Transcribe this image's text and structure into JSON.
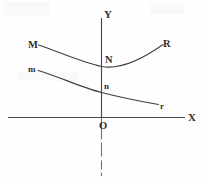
{
  "figure": {
    "background_color": "#fefefe",
    "axis_color": "#4a4a4a",
    "curve_color": "#3f3f3f",
    "label_color": "#2e2e2e"
  },
  "axes": {
    "x_axis_label": "X",
    "y_axis_label": "Y",
    "origin_label": "O",
    "x_axis": {
      "x1": 8,
      "y1": 117.5,
      "x2": 185,
      "y2": 117.5
    },
    "y_axis_above": {
      "x1": 101.5,
      "y1": 18,
      "x2": 101.5,
      "y2": 117.5
    },
    "y_axis_below": {
      "x1": 101.5,
      "y1": 117.5,
      "x2": 101.5,
      "y2": 176
    }
  },
  "curves": [
    {
      "name": "upper-curve",
      "left_label": "M",
      "right_label": "R",
      "y_intercept_label": "N",
      "shape": "convex-u-parabola",
      "path": "M 38.5,45 C 58,51.5 82,62.5 101.5,66.5 C 121,70 144,58 163,44.5",
      "left_end": [
        38.5,
        45
      ],
      "vertex": [
        108,
        67
      ],
      "right_end": [
        163,
        44.5
      ],
      "y_intercept": [
        101.5,
        66.5
      ]
    },
    {
      "name": "lower-curve",
      "left_label": "m",
      "right_label": "r",
      "y_intercept_label": "n",
      "shape": "monotone-decreasing-sigmoid",
      "path": "M 38,70.5 C 57,76 82,87.5 101.5,92.5 C 121,97.5 141,101.5 158.5,104.5",
      "left_end": [
        38,
        70.5
      ],
      "right_end": [
        158.5,
        104.5
      ],
      "y_intercept": [
        101.5,
        92.5
      ]
    }
  ],
  "labels": [
    {
      "id": "label-M",
      "text": "M",
      "x": 28,
      "y": 40,
      "style": "capital"
    },
    {
      "id": "label-R",
      "text": "R",
      "x": 163,
      "y": 39,
      "style": "capital"
    },
    {
      "id": "label-m",
      "text": "m",
      "x": 28,
      "y": 65,
      "style": "lowercase"
    },
    {
      "id": "label-r",
      "text": "r",
      "x": 160,
      "y": 102,
      "style": "lowercase"
    },
    {
      "id": "label-N",
      "text": "N",
      "x": 105,
      "y": 55,
      "style": "capital"
    },
    {
      "id": "label-n",
      "text": "n",
      "x": 104,
      "y": 82,
      "style": "lowercase"
    },
    {
      "id": "label-O",
      "text": "O",
      "x": 99,
      "y": 121,
      "style": "capital"
    },
    {
      "id": "label-X",
      "text": "X",
      "x": 188,
      "y": 112,
      "style": "axis"
    },
    {
      "id": "label-Y",
      "text": "Y",
      "x": 104,
      "y": 9,
      "style": "axis"
    }
  ]
}
